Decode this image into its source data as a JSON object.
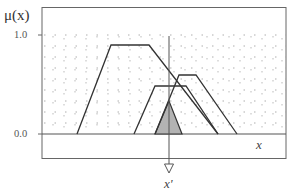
{
  "diagram": {
    "y_axis_label": "μ(x)",
    "y_ticks": [
      "1.0",
      "0.0"
    ],
    "x_axis_label": "x",
    "input_label": "x'",
    "colors": {
      "line": "#333333",
      "grid": "#999999",
      "shaded": "#b3b3b3",
      "frame": "#555555"
    },
    "membership_functions": [
      {
        "name": "left-trapezoid",
        "points": [
          [
            77,
            134
          ],
          [
            111,
            45
          ],
          [
            149,
            45
          ],
          [
            218,
            134
          ]
        ]
      },
      {
        "name": "middle-trapezoid",
        "points": [
          [
            134,
            134
          ],
          [
            155,
            86
          ],
          [
            186,
            86
          ],
          [
            218,
            134
          ]
        ]
      },
      {
        "name": "right-trapezoid",
        "points": [
          [
            155,
            134
          ],
          [
            179,
            75
          ],
          [
            196,
            75
          ],
          [
            237,
            134
          ]
        ]
      }
    ],
    "shaded_region": {
      "points": [
        [
          155,
          134
        ],
        [
          169,
          101
        ],
        [
          182,
          134
        ]
      ]
    },
    "input_line_x": 169
  }
}
